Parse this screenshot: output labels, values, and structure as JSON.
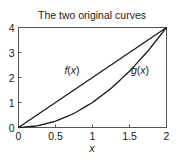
{
  "chart_data": {
    "type": "line",
    "title": "The two original curves",
    "xlabel": "x",
    "ylabel": "",
    "xlim": [
      0,
      2
    ],
    "ylim": [
      0,
      4
    ],
    "xticks": [
      0,
      0.5,
      1,
      1.5,
      2
    ],
    "xtick_labels": [
      "0",
      "0.5",
      "1",
      "1.5",
      "2"
    ],
    "yticks": [
      0,
      1,
      2,
      3,
      4
    ],
    "ytick_labels": [
      "0",
      "1",
      "2",
      "3",
      "4"
    ],
    "grid": false,
    "legend": null,
    "x": [
      0,
      0.25,
      0.5,
      0.75,
      1,
      1.25,
      1.5,
      1.75,
      2
    ],
    "series": [
      {
        "name": "f(x)",
        "label_fn": "f",
        "label_arg": "x",
        "values": [
          0,
          0.5,
          1,
          1.5,
          2,
          2.5,
          3,
          3.5,
          4
        ],
        "color": "#1a1a1a",
        "label_at": [
          0.62,
          2.15
        ]
      },
      {
        "name": "g(x)",
        "label_fn": "g",
        "label_arg": "x",
        "values": [
          0,
          0.0625,
          0.25,
          0.5625,
          1,
          1.5625,
          2.25,
          3.0625,
          4
        ],
        "color": "#1a1a1a",
        "label_at": [
          1.52,
          2.15
        ]
      }
    ],
    "annotations": [
      "f(x)",
      "g(x)"
    ]
  }
}
